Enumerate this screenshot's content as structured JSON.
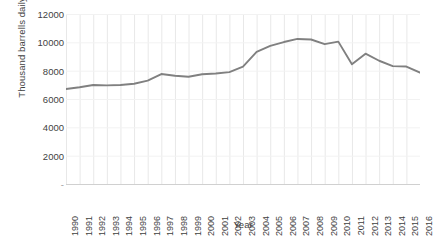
{
  "chart_data": {
    "type": "line",
    "title": "",
    "xlabel": "Year",
    "ylabel": "Thousand barrells daily",
    "ylim": [
      0,
      12000
    ],
    "y_ticks": [
      2000,
      4000,
      6000,
      8000,
      10000,
      12000
    ],
    "y_tick_labels": [
      "2000",
      "4000",
      "6000",
      "8000",
      "10000",
      "12000"
    ],
    "y_origin_label": "-",
    "grid": true,
    "grid_axis": "x",
    "legend": "none",
    "line_color": "#808080",
    "grid_color": "#e8e8e8",
    "text_color": "#3f3f3f",
    "categories": [
      "1990",
      "1991",
      "1992",
      "1993",
      "1994",
      "1995",
      "1996",
      "1997",
      "1998",
      "1999",
      "2000",
      "2001",
      "2002",
      "2003",
      "2004",
      "2005",
      "2006",
      "2007",
      "2008",
      "2009",
      "2010",
      "2011",
      "2012",
      "2013",
      "2014",
      "2015",
      "2016"
    ],
    "values": [
      6700,
      6830,
      6990,
      6960,
      6990,
      7080,
      7300,
      7760,
      7640,
      7570,
      7750,
      7800,
      7900,
      8280,
      9330,
      9750,
      10020,
      10240,
      10200,
      9870,
      10050,
      8450,
      9200,
      8700,
      8320,
      8290,
      7860
    ],
    "series": [
      {
        "name": "Thousand barrells daily",
        "values": [
          6700,
          6830,
          6990,
          6960,
          6990,
          7080,
          7300,
          7760,
          7640,
          7570,
          7750,
          7800,
          7900,
          8280,
          9330,
          9750,
          10020,
          10240,
          10200,
          9870,
          10050,
          8450,
          9200,
          8700,
          8320,
          8290,
          7860
        ]
      }
    ]
  }
}
